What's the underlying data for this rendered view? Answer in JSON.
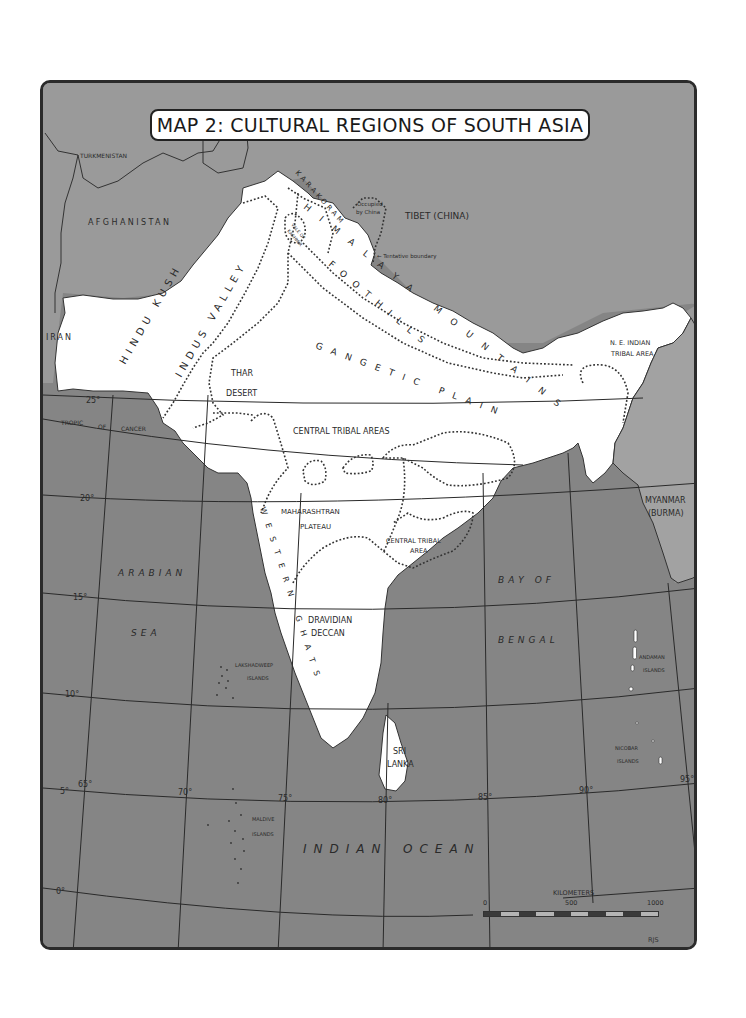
{
  "title": "MAP 2: CULTURAL REGIONS OF SOUTH ASIA",
  "colors": {
    "land_foreign": "#9a9a9a",
    "sea": "#858585",
    "south_asia": "#ffffff",
    "frame": "#2b2b2b",
    "text": "#2a2a2a"
  },
  "countries": {
    "turkmenistan": "TURKMENISTAN",
    "afghanistan": "AFGHANISTAN",
    "iran": "IRAN",
    "tibet": "TIBET (CHINA)",
    "myanmar_line1": "MYANMAR",
    "myanmar_line2": "(BURMA)",
    "sri_lanka_line1": "SRI",
    "sri_lanka_line2": "LANKA"
  },
  "annotations": {
    "occupied_line1": "Occupied",
    "occupied_line2": "by China",
    "tentative_boundary": "← Tentative boundary"
  },
  "regions": {
    "hindu_kush": "HINDU KUSH",
    "indus_valley": "INDUS VALLEY",
    "karakoram": "KARAKORAM",
    "himalaya_mountains": "HIMALAYA MOUNTAINS",
    "vale_of_kashmir_line1": "VALE OF",
    "vale_of_kashmir_line2": "KASHMIR",
    "foothills": "FOOTHILLS",
    "thar_line1": "THAR",
    "thar_line2": "DESERT",
    "gangetic_plain": "GANGETIC PLAIN",
    "ne_tribal_line1": "N. E. INDIAN",
    "ne_tribal_line2": "TRIBAL AREA",
    "central_tribal_areas": "CENTRAL TRIBAL AREAS",
    "maharashtran_line1": "MAHARASHTRAN",
    "maharashtran_line2": "PLATEAU",
    "central_tribal_area_line1": "CENTRAL TRIBAL",
    "central_tribal_area_line2": "AREA",
    "western_ghats": "WESTERN GHATS",
    "dravidian_line1": "DRAVIDIAN",
    "dravidian_line2": "DECCAN"
  },
  "water": {
    "arabian": "ARABIAN",
    "sea": "SEA",
    "bay_of": "BAY OF",
    "bengal": "BENGAL",
    "indian": "INDIAN",
    "ocean": "OCEAN"
  },
  "islands": {
    "lakshadweep_line1": "LAKSHADWEEP",
    "lakshadweep_line2": "ISLANDS",
    "maldive_line1": "MALDIVE",
    "maldive_line2": "ISLANDS",
    "andaman_line1": "ANDAMAN",
    "andaman_line2": "ISLANDS",
    "nicobar_line1": "NICOBAR",
    "nicobar_line2": "ISLANDS"
  },
  "graticule": {
    "tropic": [
      "TROPIC",
      "OF",
      "CANCER"
    ],
    "latitudes": [
      "25°",
      "20°",
      "15°",
      "10°",
      "5°",
      "0°"
    ],
    "longitudes": [
      "65°",
      "70°",
      "75°",
      "80°",
      "85°",
      "90°",
      "95°"
    ]
  },
  "scale_bar": {
    "title": "KILOMETERS",
    "ticks": [
      "0",
      "500",
      "1000"
    ]
  },
  "credit": "RJS"
}
